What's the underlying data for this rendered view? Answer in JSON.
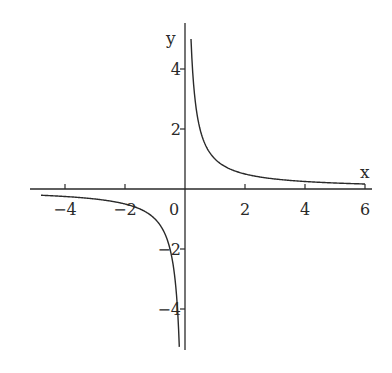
{
  "chart_data": {
    "type": "line",
    "title": "",
    "function": "y = 1/x",
    "xlabel": "x",
    "ylabel": "y",
    "xlim": [
      -5,
      6.2
    ],
    "ylim": [
      -5.4,
      5.5
    ],
    "grid": false,
    "legend": null,
    "x_ticks": [
      -4,
      -2,
      0,
      2,
      4,
      6
    ],
    "x_tick_labels": [
      "−4",
      "−2",
      "0",
      "2",
      "4",
      "6"
    ],
    "y_ticks": [
      -4,
      -2,
      2,
      4
    ],
    "y_tick_labels": [
      "−4",
      "−2",
      "2",
      "4"
    ],
    "series": [
      {
        "name": "left branch",
        "x": [
          -4.8,
          -4,
          -3,
          -2,
          -1.5,
          -1,
          -0.75,
          -0.5,
          -0.4,
          -0.3,
          -0.25,
          -0.2,
          -0.19
        ],
        "y": [
          -0.208,
          -0.25,
          -0.333,
          -0.5,
          -0.667,
          -1,
          -1.333,
          -2,
          -2.5,
          -3.333,
          -4,
          -5,
          -5.26
        ]
      },
      {
        "name": "right branch",
        "x": [
          0.2,
          0.25,
          0.3,
          0.4,
          0.5,
          0.75,
          1,
          1.5,
          2,
          3,
          4,
          5,
          6
        ],
        "y": [
          5,
          4,
          3.333,
          2.5,
          2,
          1.333,
          1,
          0.667,
          0.5,
          0.333,
          0.25,
          0.2,
          0.167
        ]
      }
    ],
    "color": "#2a2a2a"
  },
  "axes": {
    "x_label": "x",
    "y_label": "y"
  }
}
